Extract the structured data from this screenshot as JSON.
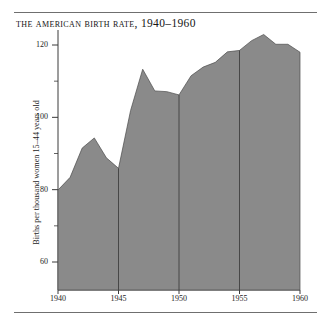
{
  "figure": {
    "title": "The American Birth Rate, 1940–1960",
    "has_top_rule": true,
    "has_bottom_rule": true,
    "background_color": "#ffffff",
    "ink_color": "#1a1a1a"
  },
  "chart_data": {
    "type": "area",
    "title": "The American Birth Rate, 1940–1960",
    "subtitle": "",
    "xlabel": "",
    "ylabel": "Births per thousand women 15–44 years old",
    "xlim": [
      1940,
      1960
    ],
    "ylim": [
      50,
      126
    ],
    "grid": false,
    "legend": "none",
    "fill_color": "#8a8a8a",
    "line_color": "#4a4a4a",
    "axis_color": "#3a3a3a",
    "y_ticks_major": [
      60,
      80,
      100,
      120
    ],
    "y_ticks_minor": [
      70,
      90,
      110
    ],
    "x_ticks": [
      1940,
      1945,
      1950,
      1955,
      1960
    ],
    "x_tick_labels": [
      "1940",
      "1945",
      "1950",
      "1955",
      "1960"
    ],
    "y_tick_labels": [
      "60",
      "80",
      "100",
      "120"
    ],
    "divider_years": [
      1945,
      1950,
      1955
    ],
    "x": [
      1940,
      1941,
      1942,
      1943,
      1944,
      1945,
      1946,
      1947,
      1948,
      1949,
      1950,
      1951,
      1952,
      1953,
      1954,
      1955,
      1956,
      1957,
      1958,
      1959,
      1960
    ],
    "values": [
      79.9,
      83.4,
      91.5,
      94.3,
      88.8,
      85.9,
      101.9,
      113.3,
      107.3,
      107.1,
      106.2,
      111.5,
      113.9,
      115.2,
      118.1,
      118.5,
      121.2,
      122.9,
      120.2,
      120.2,
      118.0
    ],
    "series": [
      {
        "name": "Births per thousand women 15–44 years old",
        "values": [
          79.9,
          83.4,
          91.5,
          94.3,
          88.8,
          85.9,
          101.9,
          113.3,
          107.3,
          107.1,
          106.2,
          111.5,
          113.9,
          115.2,
          118.1,
          118.5,
          121.2,
          122.9,
          120.2,
          120.2,
          118.0
        ]
      }
    ],
    "annotations": []
  }
}
